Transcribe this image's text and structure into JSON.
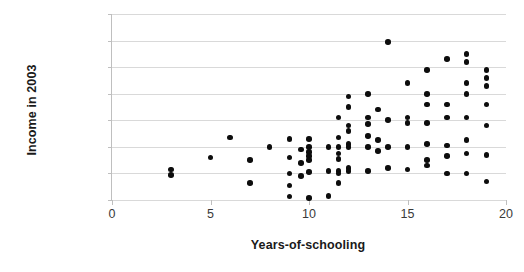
{
  "chart_data": {
    "type": "scatter",
    "title": "",
    "xlabel": "Years-of-schooling",
    "ylabel": "Income in 2003",
    "xlim": [
      0,
      20
    ],
    "ylim": [
      0,
      140000
    ],
    "xticks": [
      0,
      5,
      10,
      15,
      20
    ],
    "xtick_labels": [
      "0",
      "5",
      "10",
      "15",
      "20"
    ],
    "yticks": [
      0,
      20000,
      40000,
      60000,
      80000,
      100000,
      120000,
      140000
    ],
    "ytick_labels": [
      "$0",
      "$20,000",
      "$40,000",
      "$60,000",
      "$80,000",
      "$100,000",
      "$120,000",
      "$140,000"
    ],
    "grid": "horizontal",
    "legend": "none",
    "marker": "filled-circle",
    "marker_color": "#0d0d0d",
    "gridline_color": "#d9d9d9",
    "axis_color": "#bfbfbf",
    "series": [
      {
        "name": "Individuals",
        "points": [
          [
            3,
            23000
          ],
          [
            3,
            19000
          ],
          [
            5,
            32000
          ],
          [
            6,
            47000
          ],
          [
            7,
            30000
          ],
          [
            7,
            13000
          ],
          [
            8,
            40000
          ],
          [
            9,
            46000
          ],
          [
            9,
            32000
          ],
          [
            9,
            20000
          ],
          [
            9,
            11000
          ],
          [
            9,
            2500
          ],
          [
            9.6,
            38000
          ],
          [
            9.6,
            28000
          ],
          [
            9.6,
            18000
          ],
          [
            10,
            46000
          ],
          [
            10,
            40000
          ],
          [
            10,
            36000
          ],
          [
            10,
            33000
          ],
          [
            10,
            30000
          ],
          [
            10,
            21000
          ],
          [
            10,
            1500
          ],
          [
            11,
            40000
          ],
          [
            11,
            22000
          ],
          [
            11,
            3000
          ],
          [
            11.5,
            62000
          ],
          [
            11.5,
            47000
          ],
          [
            11.5,
            40000
          ],
          [
            11.5,
            35000
          ],
          [
            11.5,
            31000
          ],
          [
            11.5,
            22000
          ],
          [
            11.5,
            20000
          ],
          [
            11.5,
            13000
          ],
          [
            12,
            78000
          ],
          [
            12,
            70000
          ],
          [
            12,
            56000
          ],
          [
            12,
            52000
          ],
          [
            12,
            42000
          ],
          [
            12,
            40000
          ],
          [
            12,
            24000
          ],
          [
            12,
            22000
          ],
          [
            13,
            80000
          ],
          [
            13,
            62000
          ],
          [
            13,
            57000
          ],
          [
            13,
            48000
          ],
          [
            13,
            40000
          ],
          [
            13,
            22000
          ],
          [
            13.5,
            68000
          ],
          [
            13.5,
            45000
          ],
          [
            13.5,
            37000
          ],
          [
            14,
            119000
          ],
          [
            14,
            60000
          ],
          [
            14,
            40000
          ],
          [
            14,
            24000
          ],
          [
            15,
            88000
          ],
          [
            15,
            62000
          ],
          [
            15,
            58000
          ],
          [
            15,
            40000
          ],
          [
            15,
            23000
          ],
          [
            16,
            98000
          ],
          [
            16,
            80000
          ],
          [
            16,
            72000
          ],
          [
            16,
            58000
          ],
          [
            16,
            42000
          ],
          [
            16,
            30000
          ],
          [
            16,
            26000
          ],
          [
            17,
            106000
          ],
          [
            17,
            72000
          ],
          [
            17,
            62000
          ],
          [
            17,
            41000
          ],
          [
            17,
            33000
          ],
          [
            17,
            20000
          ],
          [
            18,
            110000
          ],
          [
            18,
            104000
          ],
          [
            18,
            88000
          ],
          [
            18,
            80000
          ],
          [
            18,
            62000
          ],
          [
            18,
            45000
          ],
          [
            18,
            35000
          ],
          [
            18,
            20000
          ],
          [
            19,
            98000
          ],
          [
            19,
            92000
          ],
          [
            19,
            86000
          ],
          [
            19,
            72000
          ],
          [
            19,
            56000
          ],
          [
            19,
            34000
          ],
          [
            19,
            14000
          ]
        ]
      }
    ]
  }
}
